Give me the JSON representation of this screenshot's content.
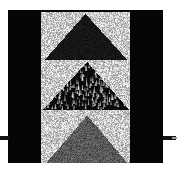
{
  "figure": {
    "canvas": {
      "width": 177,
      "height": 170,
      "background": "#ffffff"
    },
    "plate": {
      "name": "black-plate",
      "color": "#050505",
      "x": 8,
      "y": 10,
      "width": 155,
      "height": 153
    },
    "strip": {
      "name": "texture-strip",
      "x": 41,
      "y": 12,
      "width": 89,
      "height": 151
    },
    "panels": [
      {
        "id": "top",
        "label": "Top panel",
        "height": 48,
        "background_texture": "fine-grain-noise",
        "background_color": "#c8c8c8",
        "background_contrast": 0.95,
        "triangle": {
          "label": "solid dark triangle",
          "fill_texture": "solid-dark-noise",
          "fill_color": "#161616",
          "fill_contrast": 0.16,
          "apex_x_fraction": 0.5,
          "apex_y_fraction": 0.04,
          "base_left_fraction": 0.04,
          "base_right_fraction": 0.97,
          "base_y_fraction": 1.0
        }
      },
      {
        "id": "middle",
        "label": "Middle panel",
        "height": 50,
        "background_texture": "fine-grain-noise",
        "background_color": "#c8c8c8",
        "background_contrast": 0.95,
        "triangle": {
          "label": "flame-streak triangle",
          "fill_texture": "teardrop-streaks-on-black",
          "fill_color": "#0a0a0a",
          "streak_color": "#d2d2d2",
          "streak_count": 150,
          "apex_x_fraction": 0.52,
          "apex_y_fraction": 0.04,
          "base_left_fraction": 0.02,
          "base_right_fraction": 0.99,
          "base_y_fraction": 1.0
        }
      },
      {
        "id": "bottom",
        "label": "Bottom panel",
        "height": 53,
        "background_texture": "fine-grain-noise",
        "background_color": "#c8c8c8",
        "background_contrast": 0.95,
        "triangle": {
          "label": "medium-gray noise triangle",
          "fill_texture": "medium-grain-noise",
          "fill_color": "#5a5a5a",
          "fill_contrast": 0.55,
          "apex_x_fraction": 0.52,
          "apex_y_fraction": 0.1,
          "base_left_fraction": 0.06,
          "base_right_fraction": 0.97,
          "base_y_fraction": 1.0
        }
      }
    ],
    "ticks": [
      {
        "id": "tick-left",
        "label": "left axis tick",
        "x": 0,
        "y": 136,
        "width": 9,
        "color": "#141414"
      },
      {
        "id": "tick-right",
        "label": "right axis tick",
        "x": 163,
        "y": 136,
        "width": 13,
        "color": "#141414"
      }
    ]
  }
}
